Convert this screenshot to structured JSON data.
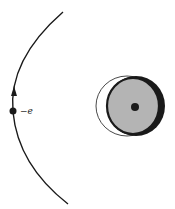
{
  "diagram": {
    "electron": {
      "label": "−e",
      "position": [
        13,
        111
      ]
    },
    "trajectory": {
      "direction": "upward",
      "arrow_at": [
        14,
        93
      ]
    },
    "atom": {
      "nucleus_center": [
        135,
        107
      ],
      "undistorted_cloud": {
        "center": [
          128,
          106
        ],
        "radius": 30,
        "style": "thin outline"
      },
      "distorted_cloud": {
        "center": [
          134,
          106
        ],
        "rx": 27,
        "ry": 30,
        "fill": "#b4b4b4",
        "style": "thick outline"
      }
    },
    "colors": {
      "line": "#1a1a1a",
      "cloud_fill": "#b4b4b4",
      "background": "#ffffff"
    }
  }
}
